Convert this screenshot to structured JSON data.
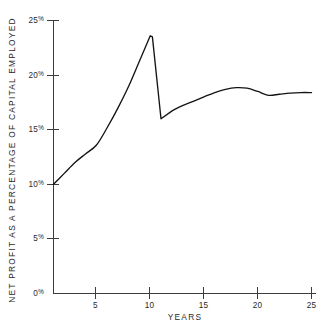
{
  "chart_data": {
    "type": "line",
    "title": "",
    "xlabel": "YEARS",
    "ylabel": "NET PROFIT AS A PERCENTAGE OF CAPITAL EMPLOYED",
    "xlim": [
      1,
      25
    ],
    "ylim": [
      0,
      25
    ],
    "grid": false,
    "legend": "none",
    "x_tick_labels": [
      "5",
      "10",
      "15",
      "20",
      "25"
    ],
    "x_ticks": [
      5,
      10,
      15,
      20,
      25
    ],
    "y_tick_labels": [
      "0%",
      "5%",
      "10%",
      "15%",
      "20%",
      "25%"
    ],
    "y_ticks": [
      0,
      5,
      10,
      15,
      20,
      25
    ],
    "y_unit": "%",
    "series": [
      {
        "name": "Net profit as a percentage of capital employed",
        "color": "#141414",
        "x": [
          1,
          2,
          3,
          4,
          5,
          6,
          7,
          8,
          9,
          10,
          10.2,
          11,
          12,
          13,
          14,
          15,
          16,
          17,
          18,
          19,
          20,
          21,
          22,
          23,
          24,
          25
        ],
        "values": [
          10.0,
          11.0,
          12.0,
          12.8,
          13.6,
          15.2,
          17.0,
          19.0,
          21.3,
          23.6,
          23.5,
          16.0,
          16.7,
          17.2,
          17.6,
          18.0,
          18.4,
          18.7,
          18.85,
          18.8,
          18.5,
          18.15,
          18.25,
          18.35,
          18.4,
          18.4
        ]
      }
    ],
    "annotations": {
      "start_value": "10%",
      "peak_year": "10",
      "peak_value": "23.6%",
      "post_drop_year": "11",
      "post_drop_value": "16%",
      "local_max_year": "18",
      "local_max_value": "18.85%",
      "end_value": "18.4%"
    }
  },
  "axes": {
    "y_title": "NET PROFIT AS A PERCENTAGE OF CAPITAL EMPLOYED",
    "x_title": "YEARS",
    "y_labels": [
      {
        "num": "25",
        "pct": "%"
      },
      {
        "num": "20",
        "pct": "%"
      },
      {
        "num": "15",
        "pct": "%"
      },
      {
        "num": "10",
        "pct": "%"
      },
      {
        "num": "5",
        "pct": "%"
      },
      {
        "num": "0",
        "pct": "%"
      }
    ],
    "x_labels": [
      "5",
      "10",
      "15",
      "20",
      "25"
    ]
  },
  "colors": {
    "curve": "#141414",
    "axis": "#3c3c3c",
    "text": "#2a2a2a",
    "background": "#ffffff"
  }
}
